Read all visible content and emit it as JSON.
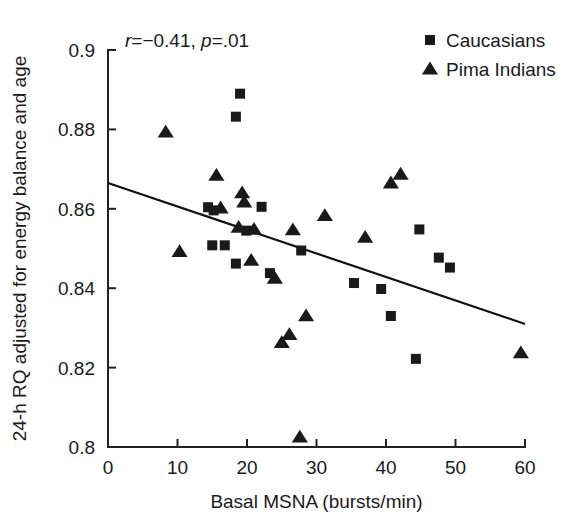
{
  "chart_data": {
    "type": "scatter",
    "title": "",
    "xlabel": "Basal MSNA (bursts/min)",
    "ylabel": "24-h RQ adjusted for energy balance and age",
    "xlim": [
      0,
      60
    ],
    "ylim": [
      0.8,
      0.9
    ],
    "xticks": [
      "0",
      "10",
      "20",
      "30",
      "40",
      "50",
      "60"
    ],
    "xtick_values": [
      0,
      10,
      20,
      30,
      40,
      50,
      60
    ],
    "yticks": [
      "0.8",
      "0.82",
      "0.84",
      "0.86",
      "0.88",
      "0.9"
    ],
    "ytick_values": [
      0.8,
      0.82,
      0.84,
      0.86,
      0.88,
      0.9
    ],
    "grid": false,
    "legend_position": "top-right",
    "annotation": {
      "r_label": "r",
      "r_text": "=−0.41,",
      "p_label": "p",
      "p_text": "=.01",
      "full": "r=−0.41, p=.01",
      "r_value": -0.41,
      "p_value": 0.01
    },
    "legend": [
      {
        "label": "Caucasians",
        "marker": "square",
        "color": "#1a1a1a"
      },
      {
        "label": "Pima Indians",
        "marker": "triangle",
        "color": "#1a1a1a"
      }
    ],
    "trendline": {
      "x": [
        0,
        60
      ],
      "y": [
        0.8665,
        0.831
      ],
      "color": "#111111"
    },
    "series": [
      {
        "name": "Caucasians",
        "marker": "square",
        "color": "#1a1a1a",
        "points": [
          [
            19.0,
            0.889
          ],
          [
            18.4,
            0.8832
          ],
          [
            14.4,
            0.8604
          ],
          [
            15.2,
            0.8596
          ],
          [
            22.1,
            0.8605
          ],
          [
            15.0,
            0.8508
          ],
          [
            16.8,
            0.8508
          ],
          [
            18.4,
            0.8462
          ],
          [
            23.3,
            0.8438
          ],
          [
            27.8,
            0.8495
          ],
          [
            35.4,
            0.8413
          ],
          [
            39.3,
            0.8398
          ],
          [
            40.7,
            0.833
          ],
          [
            44.3,
            0.8222
          ],
          [
            44.8,
            0.8548
          ],
          [
            47.6,
            0.8477
          ],
          [
            49.2,
            0.8452
          ],
          [
            19.9,
            0.8545
          ]
        ]
      },
      {
        "name": "Pima Indians",
        "marker": "triangle",
        "color": "#1a1a1a",
        "points": [
          [
            8.3,
            0.8793
          ],
          [
            10.3,
            0.8492
          ],
          [
            15.6,
            0.8684
          ],
          [
            16.2,
            0.8602
          ],
          [
            19.3,
            0.864
          ],
          [
            19.6,
            0.8617
          ],
          [
            18.8,
            0.8553
          ],
          [
            20.6,
            0.847
          ],
          [
            21.0,
            0.8548
          ],
          [
            24.0,
            0.8425
          ],
          [
            25.0,
            0.8263
          ],
          [
            26.1,
            0.8283
          ],
          [
            26.6,
            0.8547
          ],
          [
            28.5,
            0.833
          ],
          [
            27.6,
            0.8025
          ],
          [
            31.2,
            0.8583
          ],
          [
            37.0,
            0.8528
          ],
          [
            40.7,
            0.8665
          ],
          [
            42.1,
            0.8687
          ],
          [
            59.4,
            0.8237
          ]
        ]
      }
    ]
  }
}
